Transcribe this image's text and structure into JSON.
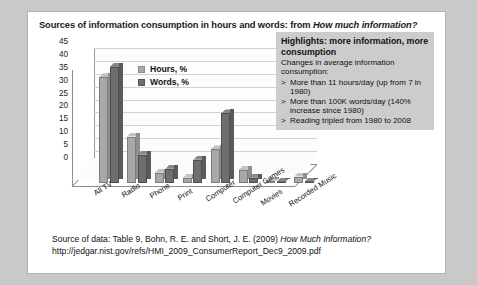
{
  "slide": {
    "title_main": "Sources of information consumption in hours and words: from ",
    "title_italic": "How much information?"
  },
  "chart_data": {
    "type": "bar",
    "title": "Sources of information consumption in hours and words: from How much information?",
    "xlabel": "",
    "ylabel": "",
    "ylim": [
      0,
      45
    ],
    "yticks": [
      "0",
      "5",
      "10",
      "15",
      "20",
      "25",
      "30",
      "35",
      "40",
      "45"
    ],
    "grid": true,
    "legend_position": "inside-top-left",
    "categories": [
      "All TV",
      "Radio",
      "Phone",
      "Print",
      "Computer",
      "Computer Games",
      "Movies",
      "Recorded Music"
    ],
    "series": [
      {
        "name": "Hours, %",
        "color": "#a8a8a8",
        "values": [
          41,
          18,
          4,
          2,
          13,
          5,
          0.6,
          2.5
        ]
      },
      {
        "name": "Words, %",
        "color": "#6e6e6e",
        "values": [
          45,
          11,
          5.5,
          9,
          27,
          2,
          0.5,
          0.3
        ]
      }
    ]
  },
  "legend": {
    "items": [
      {
        "label": "Hours, %"
      },
      {
        "label": "Words, %"
      }
    ]
  },
  "highlights": {
    "title": "Highlights: more information, more consumption",
    "subtitle": "Changes in average information consumption:",
    "bullet_marker": ">",
    "items": [
      "More than 11 hours/day (up from 7 in 1980)",
      "More than 100K words/day (140% increase since 1980)",
      "Reading tripled from 1980 to 2008"
    ]
  },
  "source": {
    "line1_main": "Source of data: Table 9, Bohn, R. E. and Short, J. E. (2009) ",
    "line1_italic": "How Much Information?",
    "line2": "http://jedgar.nist.gov/refs/HMI_2009_ConsumerReport_Dec9_2009.pdf"
  },
  "colors": {
    "hours": "#a8a8a8",
    "words": "#6e6e6e",
    "highlight_box": "#cccccc",
    "page_background": "#c9c9c9",
    "slide_background": "#ffffff"
  }
}
